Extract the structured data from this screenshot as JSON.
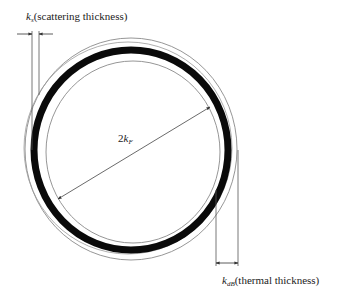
{
  "diagram": {
    "type": "kspace-shell",
    "colors": {
      "thick_ring": "#0a0a0a",
      "thin_line": "#8a8a8a",
      "dim_line": "#555555",
      "text": "#222222",
      "background": "#ffffff"
    },
    "labels": {
      "scattering_symbol": "k",
      "scattering_sub": "s",
      "scattering_text": "(scattering thickness)",
      "thermal_symbol": "k",
      "thermal_sub": "dB",
      "thermal_text": "(thermal thickness)",
      "diameter_prefix": "2",
      "diameter_symbol": "k",
      "diameter_sub": "F"
    }
  }
}
